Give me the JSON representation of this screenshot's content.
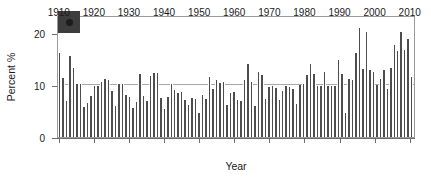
{
  "chart_data": {
    "type": "bar",
    "title": "",
    "subtitle": "",
    "xlabel": "Year",
    "ylabel": "Percent %",
    "xlim": [
      1910,
      2012
    ],
    "ylim": [
      0,
      23.5
    ],
    "y_ticks": [
      0,
      10,
      20
    ],
    "x_ticks": [
      1910,
      1920,
      1930,
      1940,
      1950,
      1960,
      1970,
      1980,
      1990,
      2000,
      2010
    ],
    "grid": "horizontal gridline at y = 10 only",
    "legend": "none",
    "panel_label": "e",
    "bar_color": "#4d4d4d",
    "frame_color": "#9a9a9a",
    "axis_color": "#6e6e6e",
    "gridline_value": 10,
    "categories": [
      1910,
      1911,
      1912,
      1913,
      1914,
      1915,
      1916,
      1917,
      1918,
      1919,
      1920,
      1921,
      1922,
      1923,
      1924,
      1925,
      1926,
      1927,
      1928,
      1929,
      1930,
      1931,
      1932,
      1933,
      1934,
      1935,
      1936,
      1937,
      1938,
      1939,
      1940,
      1941,
      1942,
      1943,
      1944,
      1945,
      1946,
      1947,
      1948,
      1949,
      1950,
      1951,
      1952,
      1953,
      1954,
      1955,
      1956,
      1957,
      1958,
      1959,
      1960,
      1961,
      1962,
      1963,
      1964,
      1965,
      1966,
      1967,
      1968,
      1969,
      1970,
      1971,
      1972,
      1973,
      1974,
      1975,
      1976,
      1977,
      1978,
      1979,
      1980,
      1981,
      1982,
      1983,
      1984,
      1985,
      1986,
      1987,
      1988,
      1989,
      1990,
      1991,
      1992,
      1993,
      1994,
      1995,
      1996,
      1997,
      1998,
      1999,
      2000,
      2001,
      2002,
      2003,
      2004,
      2005,
      2006,
      2007,
      2008,
      2009,
      2010,
      2011
    ],
    "values": [
      16.1,
      11.3,
      6.9,
      15.6,
      13.2,
      10.3,
      10.2,
      5.7,
      6.5,
      7.9,
      9.9,
      9.9,
      10.6,
      11.1,
      10.9,
      8.8,
      6.0,
      10.2,
      10.3,
      8.1,
      7.8,
      5.5,
      6.7,
      12.2,
      7.9,
      7.0,
      11.8,
      12.3,
      12.3,
      7.5,
      5.4,
      7.8,
      10.3,
      9.1,
      8.5,
      8.7,
      7.2,
      6.2,
      7.6,
      7.3,
      4.7,
      8.1,
      7.3,
      11.5,
      9.3,
      10.9,
      10.5,
      10.6,
      6.1,
      8.5,
      8.7,
      7.2,
      6.9,
      10.9,
      14.1,
      10.6,
      5.9,
      12.5,
      11.9,
      7.4,
      9.7,
      9.8,
      9.5,
      7.2,
      8.8,
      9.9,
      9.7,
      9.3,
      6.4,
      10.1,
      10.2,
      11.9,
      14.1,
      12.2,
      9.9,
      9.8,
      12.5,
      9.9,
      9.8,
      9.9,
      14.9,
      12.1,
      4.7,
      11.2,
      10.9,
      16.1,
      21.0,
      13.1,
      20.2,
      13.0,
      12.5,
      10.0,
      11.1,
      13.0,
      9.2,
      13.2,
      17.7,
      16.5,
      20.2,
      16.7,
      18.8,
      11.5
    ]
  }
}
